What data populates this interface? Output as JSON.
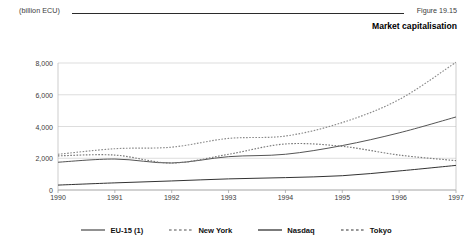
{
  "header": {
    "unit_label": "(billion ECU)",
    "figure_number": "Figure 19.15",
    "title": "Market capitalisation"
  },
  "chart_data": {
    "type": "line",
    "title": "Market capitalisation",
    "xlabel": "",
    "ylabel": "(billion ECU)",
    "unit": "billion ECU",
    "grid": true,
    "legend_position": "bottom",
    "x": [
      1990,
      1991,
      1992,
      1993,
      1994,
      1995,
      1996,
      1997
    ],
    "categories": [
      "1990",
      "1991",
      "1992",
      "1993",
      "1994",
      "1995",
      "1996",
      "1997"
    ],
    "xlim": [
      1990,
      1997
    ],
    "ylim": [
      0,
      8000
    ],
    "yticks": [
      0,
      2000,
      4000,
      6000,
      8000
    ],
    "ytick_labels": [
      "0",
      "2,000",
      "4,000",
      "6,000",
      "8,000"
    ],
    "series": [
      {
        "name": "EU-15 (1)",
        "style": "solid",
        "color": "#555555",
        "values": [
          1750,
          1950,
          1700,
          2100,
          2250,
          2800,
          3600,
          4600
        ]
      },
      {
        "name": "New York",
        "style": "dashed",
        "color": "#8a8a8a",
        "values": [
          2250,
          2600,
          2700,
          3250,
          3400,
          4250,
          5700,
          8050
        ]
      },
      {
        "name": "Nasdaq",
        "style": "solid",
        "color": "#333333",
        "values": [
          310,
          450,
          570,
          700,
          780,
          900,
          1200,
          1550
        ]
      },
      {
        "name": "Tokyo",
        "style": "dashed",
        "color": "#777777",
        "values": [
          2150,
          2200,
          1700,
          2250,
          2900,
          2750,
          2200,
          1850
        ]
      }
    ]
  },
  "legend": {
    "items": [
      {
        "label": "EU-15 (1)",
        "style": "solid"
      },
      {
        "label": "New York",
        "style": "dashed"
      },
      {
        "label": "Nasdaq",
        "style": "solid"
      },
      {
        "label": "Tokyo",
        "style": "dashed"
      }
    ]
  }
}
